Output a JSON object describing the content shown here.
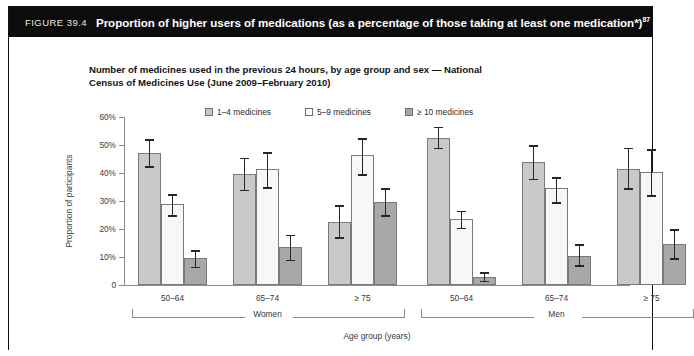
{
  "figure": {
    "number_label": "FIGURE 39.4",
    "title": "Proportion of higher users of medications (as a percentage of those taking at least one medication*)",
    "title_superscript": "87"
  },
  "chart_title": "Number of medicines used in the previous 24 hours, by age group and sex — National Census of Medicines Use (June 2009–February 2010)",
  "chart_data": {
    "type": "bar",
    "title": "Number of medicines used in the previous 24 hours, by age group and sex — National Census of Medicines Use (June 2009–February 2010)",
    "xlabel": "Age group (years)",
    "ylabel": "Proportion of participants",
    "ylim": [
      0,
      60
    ],
    "ytick_values": [
      0,
      10,
      20,
      30,
      40,
      50,
      60
    ],
    "ytick_labels": [
      "0",
      "10%",
      "20%",
      "30%",
      "40%",
      "50%",
      "60%"
    ],
    "grid": false,
    "legend_position": "top-center",
    "categories": [
      "50–64",
      "65–74",
      "≥ 75",
      "50–64",
      "65–74",
      "≥ 75"
    ],
    "supergroups": [
      {
        "label": "Women",
        "categories": [
          "50–64",
          "65–74",
          "≥ 75"
        ]
      },
      {
        "label": "Men",
        "categories": [
          "50–64",
          "65–74",
          "≥ 75"
        ]
      }
    ],
    "series": [
      {
        "name": "1–4 medicines",
        "color": "#c9c9c9",
        "values": [
          47.0,
          39.5,
          22.5,
          52.5,
          44.0,
          41.5
        ],
        "err_low": [
          42.5,
          34.0,
          17.0,
          49.0,
          38.0,
          34.5
        ],
        "err_high": [
          52.0,
          45.5,
          28.5,
          56.5,
          50.0,
          49.0
        ]
      },
      {
        "name": "5–9 medicines",
        "color": "#f7f7f7",
        "values": [
          29.0,
          41.5,
          46.5,
          23.5,
          34.5,
          40.5
        ],
        "err_low": [
          25.0,
          35.0,
          39.5,
          20.5,
          29.5,
          32.0
        ],
        "err_high": [
          32.5,
          47.5,
          52.5,
          26.5,
          38.5,
          48.5
        ]
      },
      {
        "name": "≥ 10 medicines",
        "color": "#a8a8a8",
        "values": [
          9.5,
          13.5,
          29.5,
          3.0,
          10.5,
          14.5
        ],
        "err_low": [
          6.5,
          9.0,
          25.0,
          1.5,
          7.0,
          9.5
        ],
        "err_high": [
          12.5,
          18.0,
          34.5,
          4.5,
          14.5,
          20.0
        ]
      }
    ],
    "legend": [
      "1–4 medicines",
      "5–9 medicines",
      "≥ 10 medicines"
    ]
  },
  "colors": {
    "header_bg": "#0c0c0c",
    "header_text": "#ffffff",
    "series_1": "#c9c9c9",
    "series_2": "#f7f7f7",
    "series_3": "#a8a8a8",
    "axis": "#8c8c8c",
    "error_bar": "#262626"
  }
}
